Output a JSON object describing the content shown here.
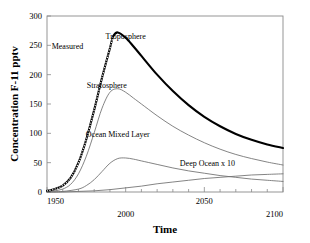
{
  "chart_data": {
    "type": "line",
    "title": "",
    "xlabel": "Time",
    "ylabel": "Concentration F-11 pptv",
    "xlim": [
      1950,
      2100
    ],
    "ylim": [
      0,
      300
    ],
    "xticks": [
      1950,
      2000,
      2050,
      2100
    ],
    "xtick_labels": [
      "1950",
      "2000",
      "2050",
      "2100"
    ],
    "xminor_step": 10,
    "yticks": [
      0,
      50,
      100,
      150,
      200,
      250,
      300
    ],
    "ytick_labels": [
      "0",
      "50",
      "100",
      "150",
      "200",
      "250",
      "300"
    ],
    "grid": false,
    "legend_position": "inline-annotations",
    "annotations": [
      {
        "text": "Measured",
        "x": 1963,
        "y": 243
      },
      {
        "text": "Troposphere",
        "x": 2000,
        "y": 260
      },
      {
        "text": "Stratosphere",
        "x": 1988,
        "y": 178
      },
      {
        "text": "Ocean Mixed Layer",
        "x": 1995,
        "y": 93
      },
      {
        "text": "Deep Ocean x 10",
        "x": 2052,
        "y": 44
      }
    ],
    "series": [
      {
        "name": "Troposphere",
        "style": "thick-solid-black",
        "x": [
          1950,
          1955,
          1960,
          1965,
          1970,
          1975,
          1980,
          1985,
          1990,
          1992,
          1995,
          2000,
          2005,
          2010,
          2020,
          2030,
          2040,
          2050,
          2060,
          2070,
          2080,
          2090,
          2100
        ],
        "values": [
          2,
          5,
          11,
          24,
          50,
          90,
          140,
          195,
          245,
          265,
          272,
          263,
          248,
          232,
          200,
          172,
          148,
          128,
          112,
          99,
          89,
          81,
          75
        ]
      },
      {
        "name": "Measured",
        "style": "dotted-overlay-on-troposphere",
        "x": [
          1950,
          1955,
          1960,
          1965,
          1970,
          1975,
          1980,
          1985,
          1990,
          1992
        ],
        "values": [
          2,
          5,
          11,
          24,
          50,
          90,
          140,
          195,
          245,
          265
        ]
      },
      {
        "name": "Stratosphere",
        "style": "thin-solid-gray",
        "x": [
          1950,
          1955,
          1960,
          1965,
          1970,
          1975,
          1980,
          1985,
          1990,
          1995,
          2000,
          2005,
          2010,
          2020,
          2030,
          2040,
          2050,
          2060,
          2070,
          2080,
          2090,
          2100
        ],
        "values": [
          0,
          2,
          5,
          13,
          31,
          61,
          101,
          143,
          170,
          176,
          170,
          160,
          150,
          130,
          112,
          97,
          84,
          73,
          64,
          57,
          51,
          46
        ]
      },
      {
        "name": "Ocean Mixed Layer",
        "style": "thin-solid-gray",
        "x": [
          1950,
          1960,
          1970,
          1975,
          1980,
          1985,
          1990,
          1995,
          2000,
          2005,
          2010,
          2020,
          2030,
          2040,
          2050,
          2060,
          2070,
          2080,
          2090,
          2100
        ],
        "values": [
          0,
          1,
          5,
          11,
          21,
          35,
          49,
          57,
          58,
          56,
          53,
          47,
          41,
          36,
          32,
          28,
          25,
          22,
          20,
          18
        ]
      },
      {
        "name": "Deep Ocean x 10",
        "style": "thin-solid-gray",
        "x": [
          1950,
          1960,
          1970,
          1980,
          1990,
          2000,
          2010,
          2020,
          2030,
          2040,
          2050,
          2060,
          2070,
          2080,
          2090,
          2100
        ],
        "values": [
          0,
          0,
          1,
          2,
          4,
          7,
          10,
          14,
          17,
          20,
          23,
          25,
          27,
          29,
          30,
          31
        ]
      }
    ]
  }
}
